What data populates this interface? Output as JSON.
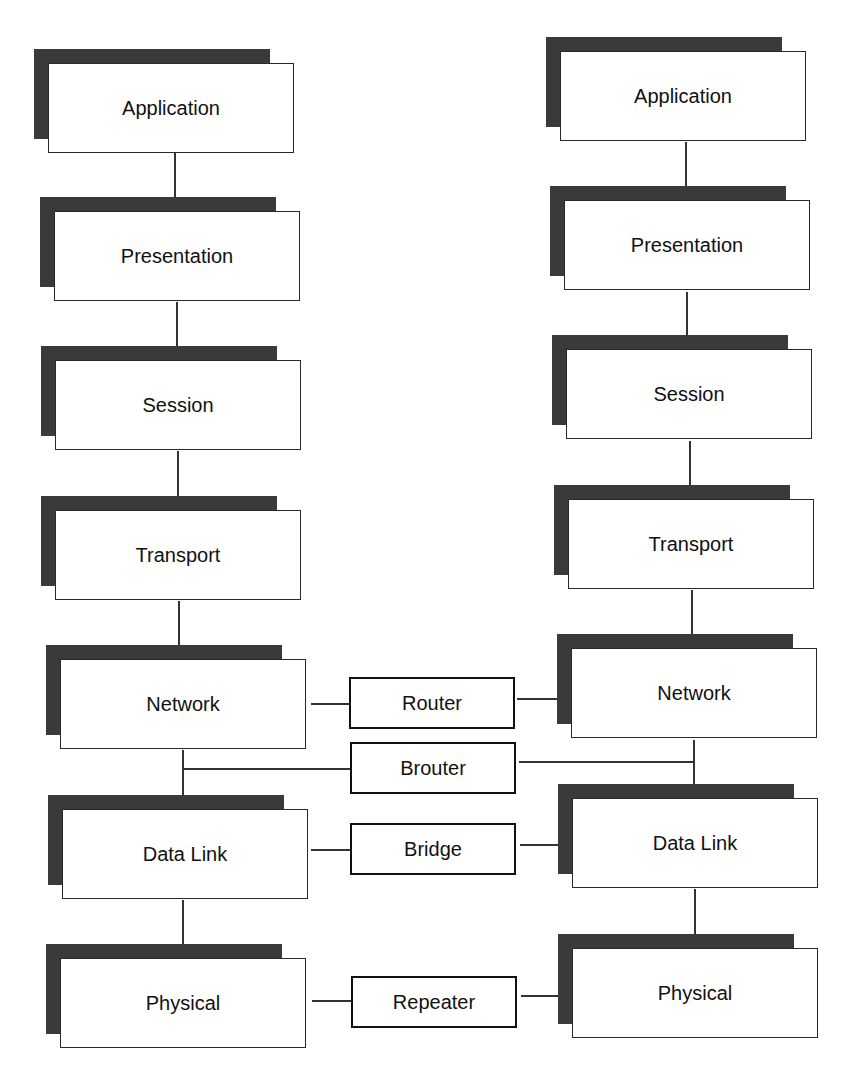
{
  "diagram": {
    "title": "",
    "left_stack": {
      "layers": [
        "Application",
        "Presentation",
        "Session",
        "Transport",
        "Network",
        "Data Link",
        "Physical"
      ]
    },
    "right_stack": {
      "layers": [
        "Application",
        "Presentation",
        "Session",
        "Transport",
        "Network",
        "Data Link",
        "Physical"
      ]
    },
    "devices": {
      "router": "Router",
      "brouter": "Brouter",
      "bridge": "Bridge",
      "repeater": "Repeater"
    },
    "colors": {
      "shadow": "#3a3a3a",
      "border": "#2a2a2a",
      "background": "#ffffff"
    }
  }
}
